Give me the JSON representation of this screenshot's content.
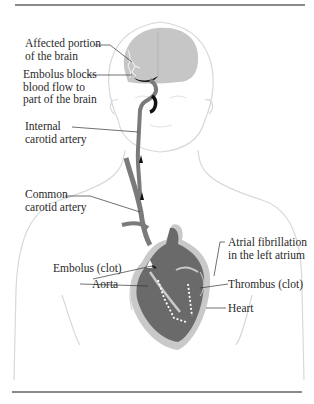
{
  "figure": {
    "type": "anatomical-diagram",
    "labels": {
      "affected_brain": [
        "Affected portion",
        "of the brain"
      ],
      "embolus_blocks": [
        "Embolus blocks",
        "blood flow to",
        "part of the brain"
      ],
      "internal_carotid": [
        "Internal",
        "carotid artery"
      ],
      "common_carotid": [
        "Common",
        "carotid artery"
      ],
      "atrial_fib": [
        "Atrial fibrillation",
        "in the left atrium"
      ],
      "embolus_clot": [
        "Embolus (clot)"
      ],
      "aorta": [
        "Aorta"
      ],
      "thrombus": [
        "Thrombus (clot)"
      ],
      "heart": [
        "Heart"
      ]
    },
    "colors": {
      "outline": "#d8d8d8",
      "brain": "#c6c6c6",
      "artery": "#7a7a7a",
      "heart": "#6a6a6a",
      "heart_wall": "#c9c9c9",
      "clot": "#111111",
      "rule": "#8a8a8a",
      "leader": "#333333"
    }
  }
}
